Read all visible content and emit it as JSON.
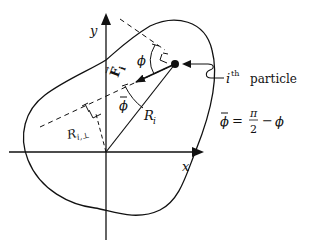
{
  "diagram": {
    "axes": {
      "x_label": "x",
      "y_label": "y"
    },
    "force": {
      "label": "F",
      "subscript": "i",
      "arrow_symbol": "→"
    },
    "angles": {
      "phi": "ϕ",
      "phi_bar": "ϕ"
    },
    "position_vector": {
      "label": "R",
      "subscript": "i"
    },
    "perpendicular": {
      "label": "R",
      "subscript": "i,⊥"
    },
    "particle_annotation": {
      "prefix": "i",
      "superscript": "th",
      "text": "particle"
    },
    "equation": {
      "lhs": "ϕ",
      "equals": "=",
      "numerator": "π",
      "denominator": "2",
      "minus": "−",
      "rhs": "ϕ"
    },
    "colors": {
      "ink": "#111111",
      "background": "#ffffff"
    }
  }
}
